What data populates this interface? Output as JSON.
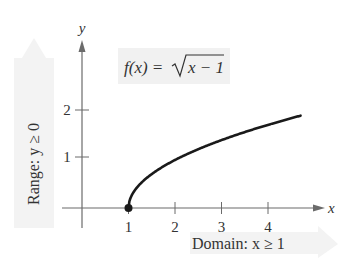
{
  "chart_data": {
    "type": "line",
    "function": "sqrt(x-1)",
    "xlabel": "x",
    "ylabel": "y",
    "x_ticks": [
      "1",
      "2",
      "3",
      "4"
    ],
    "y_ticks": [
      "1",
      "2"
    ],
    "xlim": [
      -0.4,
      4.8
    ],
    "ylim": [
      -0.4,
      3.5
    ],
    "grid": false,
    "series": [
      {
        "name": "f(x) = √(x − 1)",
        "x": [
          1,
          1.05,
          1.25,
          1.5,
          2,
          2.5,
          3,
          3.5,
          4,
          4.5,
          4.7
        ],
        "y": [
          0,
          0.224,
          0.5,
          0.707,
          1,
          1.225,
          1.414,
          1.581,
          1.732,
          1.871,
          1.924
        ]
      }
    ],
    "annotations": {
      "start_point": {
        "x": 1,
        "y": 0,
        "style": "filled-dot"
      },
      "function_label": {
        "prefix": "f(x) = ",
        "radicand": "x − 1"
      },
      "range_label": "Range: y ≥ 0",
      "domain_label": "Domain: x ≥ 1"
    }
  },
  "labels": {
    "y_axis": "y",
    "x_axis": "x",
    "func_prefix": "f(x) = ",
    "func_radicand": "x − 1",
    "range": "Range: y ≥ 0",
    "domain": "Domain: x ≥ 1",
    "xt1": "1",
    "xt2": "2",
    "xt3": "3",
    "xt4": "4",
    "yt1": "1",
    "yt2": "2"
  },
  "colors": {
    "axis": "#6b6b6b",
    "curve": "#1a1a1a",
    "label_bg": "#f1f1f1",
    "arrow_band": "#f3f3f3"
  }
}
